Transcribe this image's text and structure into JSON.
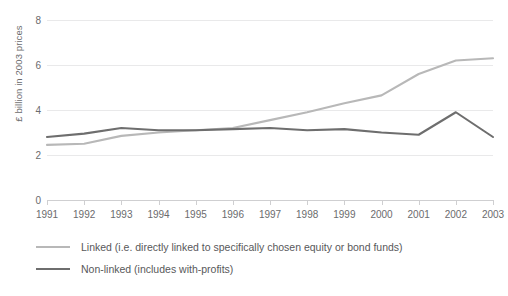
{
  "chart_data": {
    "type": "line",
    "title": "",
    "subtitle": "",
    "xlabel": "",
    "ylabel": "£ billion in 2003 prices",
    "categories": [
      "1991",
      "1992",
      "1993",
      "1994",
      "1995",
      "1996",
      "1997",
      "1998",
      "1999",
      "2000",
      "2001",
      "2002",
      "2003"
    ],
    "x_tick_labels": [
      "1991",
      "1992",
      "1993",
      "1994",
      "1995",
      "1996",
      "1997",
      "1998",
      "1999",
      "2000",
      "2001",
      "2002",
      "2003"
    ],
    "y_tick_labels": [
      "0",
      "2",
      "4",
      "6",
      "8"
    ],
    "y_ticks": [
      0,
      2,
      4,
      6,
      8
    ],
    "ylim": [
      0,
      8
    ],
    "grid": true,
    "legend_position": "below",
    "series": [
      {
        "name": "Linked (i.e. directly linked to specifically chosen equity or bond funds)",
        "color": "#b8b8b8",
        "values": [
          2.45,
          2.5,
          2.85,
          3.0,
          3.1,
          3.2,
          3.55,
          3.9,
          4.3,
          4.65,
          5.6,
          6.2,
          6.3
        ]
      },
      {
        "name": "Non-linked (includes with-profits)",
        "color": "#6e6e6e",
        "values": [
          2.8,
          2.95,
          3.2,
          3.1,
          3.1,
          3.15,
          3.2,
          3.1,
          3.15,
          3.0,
          2.9,
          3.9,
          2.8
        ]
      }
    ]
  },
  "axis": {
    "y_label": "£ billion in 2003 prices"
  },
  "legend": {
    "items": [
      {
        "label": "Linked (i.e. directly linked to specifically chosen equity or bond funds)",
        "color": "#b8b8b8"
      },
      {
        "label": "Non-linked (includes with-profits)",
        "color": "#6e6e6e"
      }
    ]
  },
  "colors": {
    "linked": "#b8b8b8",
    "non_linked": "#6e6e6e",
    "gridline": "#e9e9ea",
    "axis": "#cfcfd1",
    "text": "#6b6b6d"
  }
}
